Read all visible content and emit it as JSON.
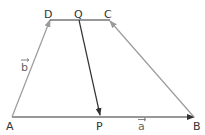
{
  "figure": {
    "type": "trapezium vector diagram",
    "points": {
      "A": {
        "label": "A",
        "x": 12,
        "y": 117
      },
      "B": {
        "label": "B",
        "x": 194,
        "y": 117
      },
      "C": {
        "label": "C",
        "x": 110,
        "y": 20
      },
      "D": {
        "label": "D",
        "x": 50,
        "y": 20
      },
      "P": {
        "label": "P",
        "x": 100,
        "y": 116
      },
      "Q": {
        "label": "Q",
        "x": 79,
        "y": 20
      }
    },
    "vectors": {
      "a": {
        "label": "a",
        "from": "A",
        "to": "B"
      },
      "b": {
        "label": "b",
        "from": "A",
        "to": "D"
      }
    },
    "colors": {
      "dark_line": "#333333",
      "gray_line": "#9a9a9a"
    }
  }
}
